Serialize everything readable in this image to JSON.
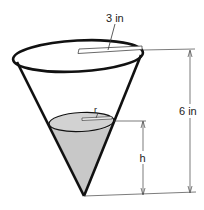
{
  "diagram": {
    "type": "conical-tank",
    "labels": {
      "top_radius": "3 in",
      "total_height": "6 in",
      "water_radius": "r",
      "water_height": "h"
    },
    "colors": {
      "outline": "#111111",
      "water_fill": "#c8c8c8",
      "dimension_lines": "#333333",
      "background": "#ffffff"
    }
  }
}
